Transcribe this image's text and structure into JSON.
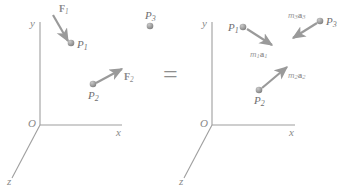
{
  "figure": {
    "relation_symbol": "=",
    "stroke_color": "#9a9a9a",
    "axis_color": "#9e9e9e",
    "dot_color": "#9b9b9b",
    "arrow_color": "#9a9a9a",
    "label_color": "#7a7a7a"
  },
  "left_frame": {
    "name": "force-diagram",
    "axes": {
      "y_label": "y",
      "x_label": "x",
      "z_label": "z",
      "origin_label": "O"
    },
    "particles": [
      {
        "id": "P1",
        "label": "P",
        "subscript": "1"
      },
      {
        "id": "P2",
        "label": "P",
        "subscript": "2"
      },
      {
        "id": "P3",
        "label": "P",
        "subscript": "3"
      }
    ],
    "vectors": [
      {
        "id": "F1",
        "label": "F",
        "subscript": "1",
        "applied_to": "P1",
        "direction": "down-right"
      },
      {
        "id": "F2",
        "label": "F",
        "subscript": "2",
        "applied_to": "P2",
        "direction": "up-right"
      }
    ]
  },
  "right_frame": {
    "name": "inertia-vector-diagram",
    "axes": {
      "y_label": "y",
      "x_label": "x",
      "z_label": "z",
      "origin_label": "O"
    },
    "particles": [
      {
        "id": "P1",
        "label": "P",
        "subscript": "1"
      },
      {
        "id": "P2",
        "label": "P",
        "subscript": "2"
      },
      {
        "id": "P3",
        "label": "P",
        "subscript": "3"
      }
    ],
    "vectors": [
      {
        "id": "m1a1",
        "mass": "m",
        "mass_sub": "1",
        "accel": "a",
        "accel_sub": "1",
        "applied_to": "P1",
        "direction": "down-right"
      },
      {
        "id": "m2a2",
        "mass": "m",
        "mass_sub": "2",
        "accel": "a",
        "accel_sub": "2",
        "applied_to": "P2",
        "direction": "up-right"
      },
      {
        "id": "m3a3",
        "mass": "m",
        "mass_sub": "3",
        "accel": "a",
        "accel_sub": "3",
        "applied_to": "P3",
        "direction": "down-left"
      }
    ]
  }
}
